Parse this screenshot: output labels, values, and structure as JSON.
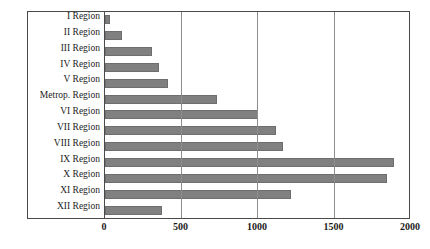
{
  "chart_data": {
    "type": "bar",
    "orientation": "horizontal",
    "title": "",
    "xlabel": "",
    "ylabel": "",
    "xlim": [
      0,
      2000
    ],
    "xticks": [
      0,
      500,
      1000,
      1500,
      2000
    ],
    "grid": true,
    "legend": false,
    "bar_color": "#808080",
    "bar_edge_color": "#6e6e6e",
    "frame_color": "#4a4a4a",
    "gridline_color": "#8d8d8d",
    "categories": [
      "I Region",
      "II Region",
      "III Region",
      "IV Region",
      "V Region",
      "Metrop. Region",
      "VI Region",
      "VII Region",
      "VIII Region",
      "IX Region",
      "X Region",
      "XI Region",
      "XII Region"
    ],
    "values": [
      30,
      110,
      305,
      355,
      410,
      730,
      1000,
      1120,
      1165,
      1890,
      1840,
      1215,
      375
    ]
  }
}
